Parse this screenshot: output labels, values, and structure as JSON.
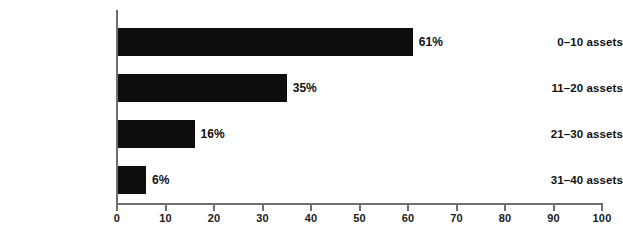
{
  "chart_data": {
    "type": "bar",
    "orientation": "horizontal",
    "title": "",
    "subtitle": "",
    "xlabel": "",
    "ylabel": "",
    "categories": [
      "0–10 assets",
      "11–20 assets",
      "21–30 assets",
      "31–40 assets"
    ],
    "values": [
      61,
      35,
      16,
      6
    ],
    "value_labels": [
      "61%",
      "35%",
      "16%",
      "6%"
    ],
    "xlim": [
      0,
      100
    ],
    "xticks": [
      0,
      10,
      20,
      30,
      40,
      50,
      60,
      70,
      80,
      90,
      100
    ],
    "xtick_labels": [
      "0",
      "10",
      "20",
      "30",
      "40",
      "50",
      "60",
      "70",
      "80",
      "90",
      "100"
    ],
    "grid": false,
    "legend": null,
    "legend_position": "none",
    "annotations": [],
    "colors": {
      "bar": "#0d0d0d",
      "axis": "#6f6f6f",
      "text": "#111111",
      "background": "#ffffff"
    }
  }
}
